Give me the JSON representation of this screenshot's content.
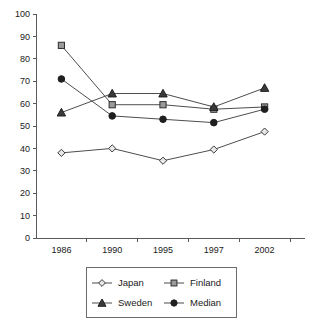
{
  "chart_data": {
    "type": "line",
    "title": "",
    "xlabel": "",
    "ylabel": "",
    "categories": [
      "1986",
      "1990",
      "1995",
      "1997",
      "2002"
    ],
    "ylim": [
      0,
      100
    ],
    "yticks": [
      0,
      10,
      20,
      30,
      40,
      50,
      60,
      70,
      80,
      90,
      100
    ],
    "ytick_labels": [
      "0",
      "10",
      "20",
      "30",
      "40",
      "50",
      "60",
      "70",
      "80",
      "90",
      "100"
    ],
    "grid": false,
    "legend_position": "bottom",
    "series": [
      {
        "name": "Japan",
        "marker": "open-diamond",
        "values": [
          38,
          40,
          34.5,
          39.5,
          47.5
        ]
      },
      {
        "name": "Finland",
        "marker": "gray-square",
        "values": [
          86,
          59.5,
          59.5,
          57.5,
          58.5
        ]
      },
      {
        "name": "Sweden",
        "marker": "filled-triangle",
        "values": [
          56,
          64.5,
          64.5,
          58.5,
          67
        ]
      },
      {
        "name": "Median",
        "marker": "filled-circle",
        "values": [
          71,
          54.5,
          53,
          51.5,
          57.5
        ]
      }
    ]
  },
  "legend": {
    "entries": [
      {
        "label": "Japan",
        "marker": "open-diamond"
      },
      {
        "label": "Finland",
        "marker": "gray-square"
      },
      {
        "label": "Sweden",
        "marker": "filled-triangle"
      },
      {
        "label": "Median",
        "marker": "filled-circle"
      }
    ]
  },
  "colors": {
    "axis": "#5a5a5a",
    "line": "#4d4d4d",
    "text": "#1a1a1a",
    "japan_marker_fill": "#e8e8e8",
    "finland_marker_fill": "#9a9a9a",
    "sweden_marker_fill": "#3a3a3a",
    "median_marker_fill": "#1f1f1f",
    "background": "#ffffff"
  }
}
